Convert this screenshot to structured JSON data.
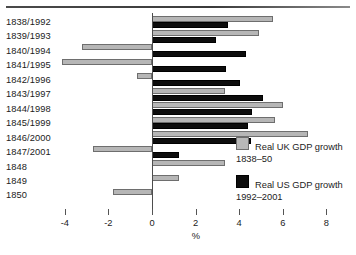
{
  "chart_data": {
    "type": "bar",
    "orientation": "horizontal",
    "title": "",
    "xlabel": "%",
    "ylabel": "",
    "xlim": [
      -4.8,
      8.4
    ],
    "xticks": [
      -4,
      -2,
      0,
      2,
      4,
      6,
      8
    ],
    "xticklabels": [
      "-4",
      "-2",
      "0",
      "2",
      "4",
      "6",
      "8"
    ],
    "grid": false,
    "legend_position": "right-middle",
    "categories": [
      "1838/1992",
      "1839/1993",
      "1840/1994",
      "1841/1995",
      "1842/1996",
      "1843/1997",
      "1844/1998",
      "1845/1999",
      "1846/2000",
      "1847/2001",
      "1848",
      "1849",
      "1850"
    ],
    "series": [
      {
        "name": "Real UK GDP growth 1838–50",
        "color": "#b6b6b6",
        "values": [
          5.55,
          4.9,
          -3.2,
          -4.15,
          -0.7,
          3.35,
          6.0,
          5.65,
          7.15,
          -2.7,
          3.35,
          1.25,
          -1.8
        ]
      },
      {
        "name": "Real US GDP growth 1992–2001",
        "color": "#0d0d0d",
        "values": [
          3.5,
          2.95,
          4.3,
          3.4,
          4.05,
          5.1,
          4.6,
          4.4,
          4.55,
          1.25,
          null,
          null,
          null
        ]
      }
    ]
  },
  "legend": [
    {
      "label_line1": "Real UK GDP growth",
      "label_line2": "1838–50",
      "swatch": "uk"
    },
    {
      "label_line1": "Real US GDP growth",
      "label_line2": "1992–2001",
      "swatch": "us"
    }
  ],
  "axis": {
    "x_title": "%",
    "zero_value": 0
  }
}
